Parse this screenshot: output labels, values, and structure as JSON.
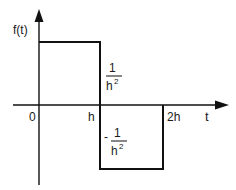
{
  "diagram": {
    "type": "piecewise-function-plot",
    "y_axis_label": "f(t)",
    "x_axis_label": "t",
    "x_ticks": [
      "0",
      "h",
      "2h"
    ],
    "positive_level": {
      "numerator": "1",
      "denominator": "h",
      "exponent": "2",
      "sign": ""
    },
    "negative_level": {
      "numerator": "1",
      "denominator": "h",
      "exponent": "2",
      "sign": "-"
    },
    "segments": [
      {
        "from": "0",
        "to": "h",
        "value": "1/h^2"
      },
      {
        "from": "h",
        "to": "2h",
        "value": "-1/h^2"
      }
    ],
    "colors": {
      "line": "#111111",
      "background": "#ffffff"
    }
  }
}
